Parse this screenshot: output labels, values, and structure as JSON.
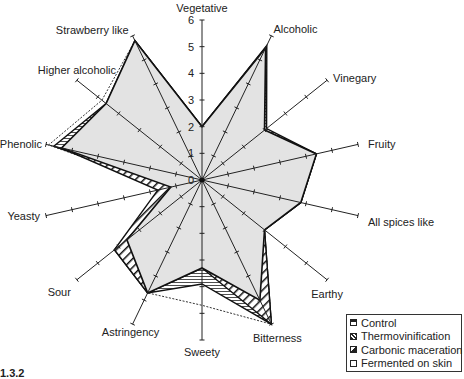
{
  "chart_data": {
    "type": "radar",
    "title": "",
    "axes": [
      "Vegetative",
      "Alcoholic",
      "Vinegary",
      "Fruity",
      "All spices like",
      "Earthy",
      "Bitterness",
      "Sweety",
      "Astringency",
      "Sour",
      "Yeasty",
      "Phenolic",
      "Higher alcoholic",
      "Strawberry like"
    ],
    "radial_ticks": [
      "0",
      "1",
      "2",
      "3",
      "4",
      "5",
      "6"
    ],
    "rmax": 6,
    "grid": false,
    "legend_position": "bottom-right",
    "series": [
      {
        "name": "Fermented on skin",
        "values": [
          2.0,
          5.5,
          3.0,
          4.4,
          3.8,
          3.0,
          6.0,
          4.7,
          4.7,
          4.2,
          1.3,
          5.9,
          4.8,
          5.8
        ]
      },
      {
        "name": "Carbonic maceration",
        "values": [
          2.0,
          5.6,
          3.1,
          4.4,
          3.8,
          3.0,
          6.0,
          3.9,
          4.7,
          4.2,
          1.2,
          5.7,
          4.6,
          5.8
        ]
      },
      {
        "name": "Thermovinification",
        "values": [
          2.0,
          5.5,
          3.0,
          4.4,
          3.8,
          3.0,
          6.0,
          3.3,
          4.7,
          4.2,
          1.7,
          5.4,
          4.2,
          5.8
        ]
      },
      {
        "name": "Control",
        "values": [
          2.0,
          5.5,
          3.0,
          4.4,
          3.8,
          3.0,
          5.0,
          3.3,
          4.7,
          3.6,
          1.2,
          5.4,
          4.6,
          5.8
        ]
      }
    ]
  },
  "legend": {
    "items": [
      {
        "label": "Control"
      },
      {
        "label": "Thermovinification"
      },
      {
        "label": "Carbonic maceration"
      },
      {
        "label": "Fermented on skin"
      }
    ]
  },
  "caption": "1.3.2"
}
